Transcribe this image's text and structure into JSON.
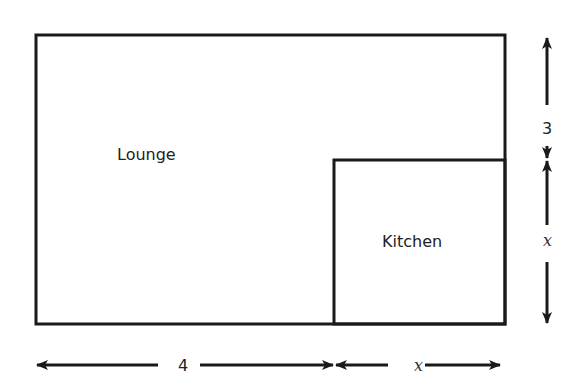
{
  "diagram": {
    "rooms": [
      {
        "name": "Lounge"
      },
      {
        "name": "Kitchen"
      }
    ],
    "dimensions": {
      "right_top": "3",
      "right_bottom": "x",
      "bottom_left": "4",
      "bottom_right": "x"
    },
    "colors": {
      "stroke": "#1a1a1a",
      "text": "#222222",
      "background": "#ffffff"
    }
  }
}
